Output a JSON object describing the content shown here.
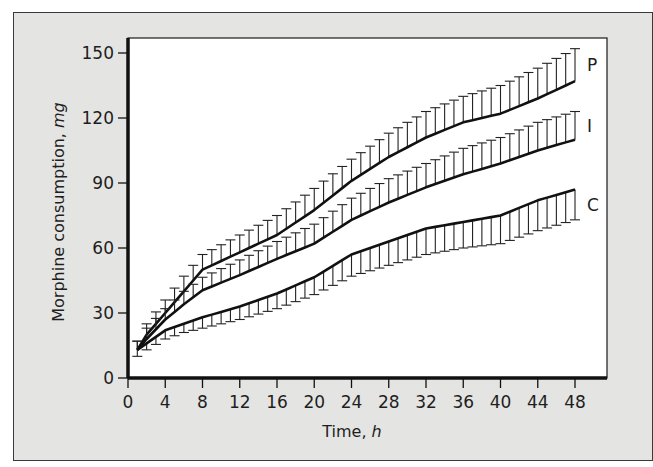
{
  "chart_data": {
    "type": "line",
    "title": "",
    "xlabel": "Time, h",
    "xlabel_main": "Time, ",
    "xlabel_unit": "h",
    "ylabel": "Morphine consumption, mg",
    "ylabel_main": "Morphine consumption, ",
    "ylabel_unit": "mg",
    "xlim": [
      0,
      48
    ],
    "ylim": [
      0,
      150
    ],
    "x_ticks": [
      0,
      4,
      8,
      12,
      16,
      20,
      24,
      28,
      32,
      36,
      40,
      44,
      48
    ],
    "y_ticks": [
      0,
      30,
      60,
      90,
      120,
      150
    ],
    "grid": false,
    "legend": "inline labels at line ends",
    "error_bars": "P and I: upward (+SE); C: downward (-SE)",
    "x": [
      1,
      2,
      4,
      6,
      8,
      12,
      16,
      20,
      24,
      28,
      32,
      36,
      40,
      44,
      48
    ],
    "series": [
      {
        "name": "P",
        "values": [
          13,
          20,
          30,
          40,
          50,
          58,
          66,
          77.5,
          91,
          102,
          111,
          118,
          122,
          129,
          137
        ],
        "error_dir": "up",
        "error": [
          4,
          5,
          6,
          7,
          7,
          8,
          9,
          10,
          10,
          11,
          12,
          12,
          13,
          14,
          15
        ]
      },
      {
        "name": "I",
        "values": [
          13,
          18,
          27,
          34,
          40.5,
          47.5,
          55,
          62,
          73,
          81,
          88,
          94,
          99,
          105,
          110
        ],
        "error_dir": "up",
        "error": [
          4,
          5,
          5,
          6,
          6,
          7,
          8,
          9,
          10,
          11,
          11,
          12,
          12,
          13,
          13
        ]
      },
      {
        "name": "C",
        "values": [
          13,
          16,
          22,
          25,
          28,
          33,
          39,
          46.5,
          57,
          63,
          69,
          72,
          75,
          82,
          87
        ],
        "error_dir": "down",
        "error": [
          3,
          3,
          4,
          4,
          5,
          6,
          7,
          8,
          10,
          11,
          12,
          12,
          13,
          14,
          14
        ]
      }
    ]
  }
}
